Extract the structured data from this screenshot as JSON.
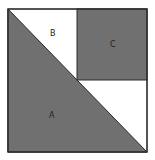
{
  "diagram": {
    "title": "",
    "colors": {
      "shaded": "#707070",
      "unshaded": "#ffffff",
      "stroke": "#2a2a2a"
    },
    "outer_square": {
      "x": 8,
      "y": 9,
      "size": 139
    },
    "regions": [
      {
        "id": "A",
        "label": "A",
        "shape": "triangle",
        "shaded": true,
        "label_pos": [
          52,
          117
        ]
      },
      {
        "id": "B",
        "label": "B",
        "shape": "white-region",
        "shaded": false,
        "label_pos": [
          53,
          35
        ]
      },
      {
        "id": "C",
        "label": "C",
        "shape": "square",
        "shaded": true,
        "label_pos": [
          113,
          46
        ]
      }
    ]
  }
}
